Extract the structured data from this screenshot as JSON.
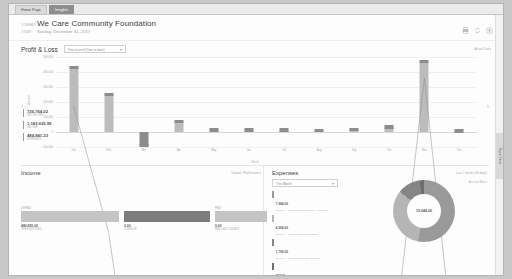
{
  "tabs": [
    {
      "label": "Home Page",
      "active": false
    },
    {
      "label": "Insights",
      "active": true
    }
  ],
  "header": {
    "company_label": "COMPANY",
    "company": "We Care Community Foundation",
    "date_label": "TODAY",
    "date": "Sunday, December 31, 2017",
    "tools": [
      {
        "name": "print-icon",
        "label": "Print"
      },
      {
        "name": "refresh-icon",
        "label": "Refresh"
      },
      {
        "name": "settings-icon",
        "label": "Settings"
      }
    ]
  },
  "profit_loss": {
    "title": "Profit & Loss",
    "period_value": "Year-to-end (Year to date)",
    "period_options": [
      "Year-to-end (Year to date)",
      "This Fiscal Year",
      "Last Fiscal Year",
      "This Month"
    ],
    "corner_label": "Actual Data",
    "nav_prev": "‹",
    "nav_next": "›",
    "kpis": [
      {
        "value": "726,764.02",
        "label": "NET INCOME"
      },
      {
        "value": "1,182,635.99",
        "label": "INCOME"
      },
      {
        "value": "484,841.23",
        "label": "EXPENSES"
      }
    ]
  },
  "chart_data": {
    "type": "bar",
    "title": "Profit & Loss",
    "xlabel": "Month",
    "ylabel": "Amount",
    "categories": [
      "Jan",
      "Feb",
      "Mar",
      "Apr",
      "May",
      "Jun",
      "Jul",
      "Aug",
      "Sep",
      "Oct",
      "Nov",
      "Dec"
    ],
    "ylim": [
      -100000,
      500000
    ],
    "yticks": [
      500000,
      400000,
      300000,
      200000,
      100000,
      0,
      -100000
    ],
    "ytick_labels": [
      "500,000",
      "400,000",
      "300,000",
      "200,000",
      "100,000",
      "0",
      "-100,000"
    ],
    "grid": true,
    "legend_position": "none",
    "series": [
      {
        "name": "Net Income",
        "type": "bar",
        "values": [
          430000,
          250000,
          -90000,
          70000,
          12000,
          12000,
          14000,
          10000,
          18000,
          35000,
          470000,
          8000
        ]
      },
      {
        "name": "Trend",
        "type": "line",
        "values": [
          430000,
          250000,
          -90000,
          70000,
          12000,
          12000,
          14000,
          10000,
          18000,
          35000,
          470000,
          8000
        ]
      }
    ]
  },
  "income": {
    "title": "Income",
    "link": "Unpaid / Paid Invoices",
    "bars": [
      {
        "label": "UNPAID",
        "value": "480,855.00",
        "sub": "OPEN INVOICES",
        "width": 98,
        "tone": "light"
      },
      {
        "label": "",
        "value": "0.00",
        "sub": "OVERDUE",
        "width": 86,
        "tone": "dark"
      },
      {
        "label": "PAID",
        "value": "0.00",
        "sub": "PAID LAST 30 DAYS",
        "width": 52,
        "tone": "light"
      }
    ]
  },
  "expenses": {
    "title": "Expenses",
    "link": "Last 7 weeks (30 days)",
    "sublink": "Accrual Basis",
    "filter_value": "This Month",
    "filter_options": [
      "This Month",
      "Last Month",
      "This Quarter",
      "This Year"
    ],
    "total": "15,044.00",
    "legend": [
      {
        "value": "7,984.00",
        "desc": "53.07% — Total Professional Fees / Accounting",
        "color": "#9a9a9a"
      },
      {
        "value": "4,908.00",
        "desc": "32.63% — Rent or Lease of Buildings",
        "color": "#b5b5b5"
      },
      {
        "value": "1,799.00",
        "desc": "11.96% — Job Materials / Job Supplies",
        "color": "#858585"
      },
      {
        "value": "353.00",
        "desc": "2.35% — Utilities",
        "color": "#6e6e6e"
      }
    ],
    "slices": [
      {
        "pct": 53.07,
        "color": "#9a9a9a"
      },
      {
        "pct": 32.63,
        "color": "#b5b5b5"
      },
      {
        "pct": 11.95,
        "color": "#858585"
      },
      {
        "pct": 2.35,
        "color": "#6e6e6e"
      }
    ]
  },
  "rail": {
    "label": "Report Panel"
  }
}
